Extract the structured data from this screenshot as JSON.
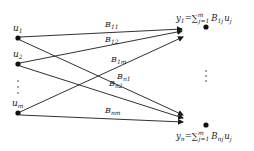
{
  "diagram": {
    "type": "bipartite-network",
    "inputs": [
      {
        "id": "u1",
        "base": "u",
        "sub": "1"
      },
      {
        "id": "u2",
        "base": "u",
        "sub": "2"
      },
      {
        "id": "um",
        "base": "u",
        "sub": "m"
      }
    ],
    "outputs": [
      {
        "id": "y1",
        "base": "y",
        "sub": "1",
        "eq_pre": "=∑",
        "sum_top": "m",
        "sum_bot": "j=1",
        "coef": "B",
        "coef_sub": "1j",
        "var": "u",
        "var_sub": "j"
      },
      {
        "id": "yn",
        "base": "y",
        "sub": "n",
        "eq_pre": "=∑",
        "sum_top": "m",
        "sum_bot": "j=1",
        "coef": "B",
        "coef_sub": "nj",
        "var": "u",
        "var_sub": "j"
      }
    ],
    "edges": [
      {
        "from": "u1",
        "to": "y1",
        "label": "B",
        "label_sub": "11"
      },
      {
        "from": "u2",
        "to": "y1",
        "label": "B",
        "label_sub": "12"
      },
      {
        "from": "um",
        "to": "y1",
        "label": "B",
        "label_sub": "1m"
      },
      {
        "from": "u1",
        "to": "yn",
        "label": "B",
        "label_sub": "n1"
      },
      {
        "from": "u2",
        "to": "yn",
        "label": "B",
        "label_sub": "n2"
      },
      {
        "from": "um",
        "to": "yn",
        "label": "B",
        "label_sub": "nm"
      }
    ],
    "ellipsis_left": "⋮",
    "ellipsis_right": "⋮",
    "line_color": "#1a1a1a",
    "node_color": "#111111"
  }
}
